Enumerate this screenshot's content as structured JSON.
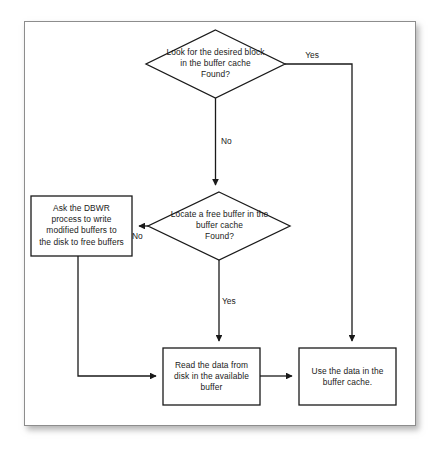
{
  "diagram": {
    "type": "flowchart",
    "background_color": "#ffffff",
    "frame_color": "#8d8d8d",
    "line_color": "#1a1a1a",
    "text_color": "#1a1a1a",
    "nodes": [
      {
        "id": "decision_find_block",
        "shape": "diamond",
        "text": "Look for the desired block\nin the buffer cache\nFound?"
      },
      {
        "id": "decision_free_buffer",
        "shape": "diamond",
        "text": "Locate a free buffer in the\nbuffer cache\nFound?"
      },
      {
        "id": "process_dbwr",
        "shape": "rectangle",
        "text": "Ask the DBWR\nprocess to write\nmodified buffers to\nthe disk to free buffers"
      },
      {
        "id": "process_read_disk",
        "shape": "rectangle",
        "text": "Read the data from\ndisk in the available\nbuffer"
      },
      {
        "id": "process_use_data",
        "shape": "rectangle",
        "text": "Use the data in the\nbuffer cache."
      }
    ],
    "edges": [
      {
        "id": "edge_found_yes",
        "from": "decision_find_block",
        "to": "process_use_data",
        "label": "Yes"
      },
      {
        "id": "edge_found_no",
        "from": "decision_find_block",
        "to": "decision_free_buffer",
        "label": "No"
      },
      {
        "id": "edge_free_no",
        "from": "decision_free_buffer",
        "to": "process_dbwr",
        "label": "No"
      },
      {
        "id": "edge_free_yes",
        "from": "decision_free_buffer",
        "to": "process_read_disk",
        "label": "Yes"
      },
      {
        "id": "edge_dbwr_to_read",
        "from": "process_dbwr",
        "to": "process_read_disk",
        "label": ""
      },
      {
        "id": "edge_read_to_use",
        "from": "process_read_disk",
        "to": "process_use_data",
        "label": ""
      }
    ]
  }
}
